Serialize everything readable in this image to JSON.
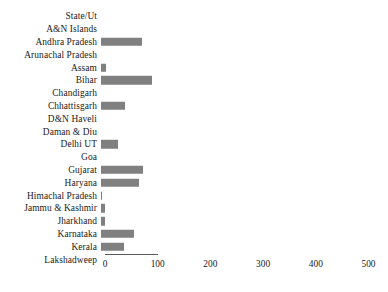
{
  "chart_data": {
    "type": "bar",
    "orientation": "horizontal",
    "title": "",
    "xlabel": "",
    "ylabel": "",
    "grid": false,
    "legend": null,
    "xlim": [
      0,
      500
    ],
    "xticks": [
      0,
      100,
      200,
      300,
      400,
      500
    ],
    "xtick_labels": [
      "0",
      "100",
      "200",
      "300",
      "400",
      "500"
    ],
    "axis_line_extent": [
      0,
      100
    ],
    "bar_color": "#808080",
    "categories": [
      "State/Ut",
      "A&N Islands",
      "Andhra Pradesh",
      "Arunachal Pradesh",
      "Assam",
      "Bihar",
      "Chandigarh",
      "Chhattisgarh",
      "D&N Haveli",
      "Daman & Diu",
      "Delhi UT",
      "Goa",
      "Gujarat",
      "Haryana",
      "Himachal Pradesh",
      "Jammu & Kashmir",
      "Jharkhand",
      "Karnataka",
      "Kerala",
      "Lakshadweep"
    ],
    "values": [
      0,
      0,
      78,
      0,
      10,
      97,
      0,
      45,
      0,
      0,
      32,
      0,
      79,
      73,
      2,
      7,
      7,
      63,
      44,
      0
    ]
  }
}
